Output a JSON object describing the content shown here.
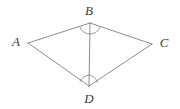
{
  "figure": {
    "stroke_color": "#8c8c8c",
    "label_color": "#3a3a3a",
    "background_color": "#ffffff",
    "width": 180,
    "height": 109,
    "vertices": [
      {
        "id": "A",
        "label": "A",
        "x": 28,
        "y": 43,
        "label_x": 16,
        "label_y": 46
      },
      {
        "id": "B",
        "label": "B",
        "x": 90,
        "y": 23,
        "label_x": 89,
        "label_y": 15
      },
      {
        "id": "C",
        "label": "C",
        "x": 152,
        "y": 44,
        "label_x": 164,
        "label_y": 47
      },
      {
        "id": "D",
        "label": "D",
        "x": 89,
        "y": 86,
        "label_x": 89,
        "label_y": 103
      }
    ],
    "edges": [
      {
        "id": "AB",
        "from": "A",
        "to": "B",
        "x1": 28,
        "y1": 43,
        "x2": 90,
        "y2": 23
      },
      {
        "id": "BC",
        "from": "B",
        "to": "C",
        "x1": 90,
        "y1": 23,
        "x2": 152,
        "y2": 44
      },
      {
        "id": "CD",
        "from": "C",
        "to": "D",
        "x1": 152,
        "y1": 44,
        "x2": 89,
        "y2": 86
      },
      {
        "id": "DA",
        "from": "D",
        "to": "A",
        "x1": 89,
        "y1": 86,
        "x2": 28,
        "y2": 43
      }
    ],
    "diagonals": [
      {
        "id": "BD",
        "from": "B",
        "to": "D",
        "x1": 90,
        "y1": 23,
        "x2": 89,
        "y2": 86
      }
    ],
    "angle_marks": [
      {
        "id": "angle-ABD",
        "vertex": "B",
        "path": "M 79.6 26.4 A 11 11 0 0 0 89.9 34.0",
        "ticks": 1
      },
      {
        "id": "angle-CBD",
        "vertex": "B",
        "path": "M 89.9 34.0 A 11 11 0 0 0 100.3 26.5",
        "ticks": 1
      },
      {
        "id": "angle-ADB",
        "vertex": "D",
        "path": "M 89.1 75.0 A 11 11 0 0 0 80.1 81.5",
        "ticks": 1
      },
      {
        "id": "angle-BDC",
        "vertex": "D",
        "path": "M 89.1 75.0 A 11 11 0 0 1 97.4 82.2",
        "ticks": 1
      }
    ]
  }
}
